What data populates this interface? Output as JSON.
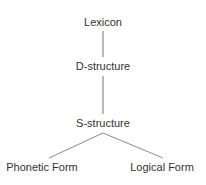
{
  "diagram": {
    "type": "tree",
    "nodes": {
      "lexicon": "Lexicon",
      "d_structure": "D-structure",
      "s_structure": "S-structure",
      "phonetic_form": "Phonetic Form",
      "logical_form": "Logical Form"
    },
    "edges": [
      [
        "Lexicon",
        "D-structure"
      ],
      [
        "D-structure",
        "S-structure"
      ],
      [
        "S-structure",
        "Phonetic Form"
      ],
      [
        "S-structure",
        "Logical Form"
      ]
    ],
    "colors": {
      "text": "#333333",
      "line": "#8a8a8a"
    }
  }
}
